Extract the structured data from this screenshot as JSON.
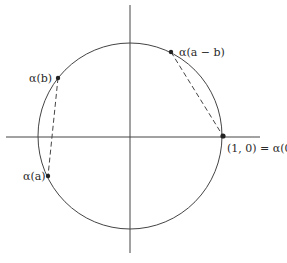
{
  "diagram": {
    "type": "unit-circle",
    "colors": {
      "stroke": "#444444",
      "background": "#ffffff",
      "point": "#222222"
    },
    "circle": {
      "cx": 130,
      "cy": 136,
      "rx": 92,
      "ry": 93
    },
    "axes": {
      "x": {
        "x1": 6,
        "x2": 260,
        "y": 137
      },
      "y": {
        "x": 130,
        "y1": 5,
        "y2": 253
      }
    },
    "points": [
      {
        "id": "alpha_b",
        "label": "α(b)",
        "x": 58,
        "y": 78
      },
      {
        "id": "alpha_a",
        "label": "α(a)",
        "x": 48,
        "y": 176
      },
      {
        "id": "alpha_a_minus_b",
        "label": "α(a − b)",
        "x": 171,
        "y": 52
      },
      {
        "id": "origin_point",
        "label": "(1, 0) = α(0)",
        "x": 223,
        "y": 136
      }
    ],
    "chords": [
      {
        "from": "alpha_b",
        "to": "alpha_a",
        "style": "dashed"
      },
      {
        "from": "alpha_a_minus_b",
        "to": "origin_point",
        "style": "dashed"
      }
    ]
  }
}
